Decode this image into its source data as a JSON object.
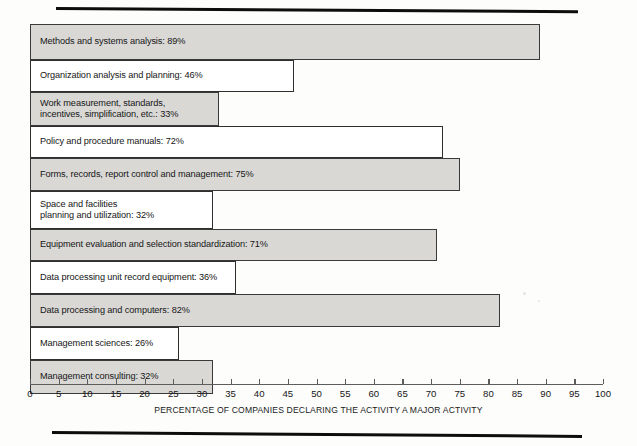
{
  "chart_data": {
    "type": "bar",
    "orientation": "horizontal",
    "title": "",
    "xlabel": "PERCENTAGE OF COMPANIES DECLARING THE ACTIVITY A MAJOR ACTIVITY",
    "ylabel": "",
    "xlim": [
      0,
      100
    ],
    "xticks": [
      0,
      5,
      10,
      15,
      20,
      25,
      30,
      35,
      40,
      45,
      50,
      55,
      60,
      65,
      70,
      75,
      80,
      85,
      90,
      95,
      100
    ],
    "grid": false,
    "legend": null,
    "categories": [
      "Methods and systems analysis",
      "Organization analysis and planning",
      "Work measurement, standards,\nincentives, simplification, etc.",
      "Policy and procedure manuals",
      "Forms, records, report control and management",
      "Space and facilities\nplanning and utilization",
      "Equipment evaluation and selection standardization",
      "Data processing unit record equipment",
      "Data processing and computers",
      "Management sciences",
      "Management consulting"
    ],
    "values": [
      89,
      46,
      33,
      72,
      75,
      32,
      71,
      36,
      82,
      26,
      32
    ],
    "bars": [
      {
        "label": "Methods and systems analysis: 89%",
        "value": 89,
        "fill": "gray",
        "height": 36
      },
      {
        "label": "Organization analysis and planning: 46%",
        "value": 46,
        "fill": "white",
        "height": 32
      },
      {
        "label": "Work measurement, standards,\nincentives, simplification, etc.: 33%",
        "value": 33,
        "fill": "gray",
        "height": 34
      },
      {
        "label": "Policy and procedure manuals: 72%",
        "value": 72,
        "fill": "white",
        "height": 32
      },
      {
        "label": "Forms, records, report control and management: 75%",
        "value": 75,
        "fill": "gray",
        "height": 33
      },
      {
        "label": "Space and facilities\nplanning and utilization: 32%",
        "value": 32,
        "fill": "white",
        "height": 38
      },
      {
        "label": "Equipment evaluation and selection standardization: 71%",
        "value": 71,
        "fill": "gray",
        "height": 32
      },
      {
        "label": "Data processing unit record equipment: 36%",
        "value": 36,
        "fill": "white",
        "height": 33
      },
      {
        "label": "Data processing and computers: 82%",
        "value": 82,
        "fill": "gray",
        "height": 33
      },
      {
        "label": "Management sciences: 26%",
        "value": 26,
        "fill": "white",
        "height": 33
      },
      {
        "label": "Management consulting: 32%",
        "value": 32,
        "fill": "gray",
        "height": 34
      }
    ],
    "colors": {
      "bar_gray": "#d9d8d5",
      "bar_white": "#ffffff",
      "bar_border": "#2f2f2f",
      "axis": "#5d5d5d",
      "text": "#161616",
      "rule": "#0d0d0d",
      "page_background": "#fdfdfc"
    }
  }
}
